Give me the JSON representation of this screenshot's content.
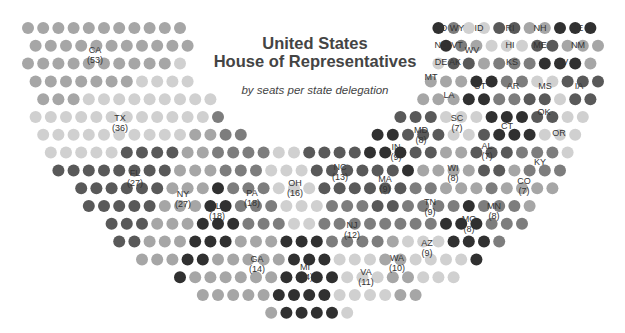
{
  "title_line1": "United States",
  "title_line2": "House of Representatives",
  "subtitle": "by seats per state delegation",
  "colors": {
    "light": "#d0d0d0",
    "medium": "#a6a6a6",
    "middark": "#7d7d7d",
    "dark": "#595959",
    "darkest": "#303030",
    "label_text": "#333333",
    "title_text": "#444444"
  },
  "grid": {
    "center_x": 312,
    "center_y": 28,
    "outer_rx": 292,
    "outer_ry": 288,
    "inner_rx": 124,
    "inner_ry": 124,
    "dx": 15.2,
    "dy": 17.8,
    "top": 28,
    "radius": 6
  },
  "chart_data": {
    "type": "hemicycle",
    "title": "United States House of Representatives",
    "subtitle": "by seats per state delegation",
    "total_seats": 435,
    "states": [
      {
        "state": "CA",
        "seats": 53,
        "x": 95,
        "y": 55
      },
      {
        "state": "TX",
        "seats": 36,
        "x": 120,
        "y": 123
      },
      {
        "state": "FL",
        "seats": 27,
        "x": 135,
        "y": 178
      },
      {
        "state": "NY",
        "seats": 27,
        "x": 183,
        "y": 199
      },
      {
        "state": "IL",
        "seats": 18,
        "x": 217,
        "y": 211
      },
      {
        "state": "PA",
        "seats": 18,
        "x": 252,
        "y": 198
      },
      {
        "state": "OH",
        "seats": 16,
        "x": 295,
        "y": 188
      },
      {
        "state": "NC",
        "seats": 13,
        "x": 340,
        "y": 172
      },
      {
        "state": "GA",
        "seats": 14,
        "x": 257,
        "y": 264
      },
      {
        "state": "MI",
        "seats": 14,
        "x": 305,
        "y": 272
      },
      {
        "state": "NJ",
        "seats": 12,
        "x": 352,
        "y": 230
      },
      {
        "state": "VA",
        "seats": 11,
        "x": 366,
        "y": 277
      },
      {
        "state": "MA",
        "seats": 9,
        "x": 385,
        "y": 184
      },
      {
        "state": "WA",
        "seats": 10,
        "x": 397,
        "y": 263
      },
      {
        "state": "IN",
        "seats": 9,
        "x": 396,
        "y": 152
      },
      {
        "state": "TN",
        "seats": 9,
        "x": 430,
        "y": 207
      },
      {
        "state": "AZ",
        "seats": 9,
        "x": 427,
        "y": 248
      },
      {
        "state": "MD",
        "seats": 8,
        "x": 421,
        "y": 135
      },
      {
        "state": "WI",
        "seats": 8,
        "x": 453,
        "y": 173
      },
      {
        "state": "MO",
        "seats": 8,
        "x": 469,
        "y": 224
      },
      {
        "state": "MN",
        "seats": 8,
        "x": 494,
        "y": 211
      },
      {
        "state": "SC",
        "seats": 7,
        "x": 457,
        "y": 123
      },
      {
        "state": "AL",
        "seats": 7,
        "x": 487,
        "y": 151
      },
      {
        "state": "CO",
        "seats": 7,
        "x": 524,
        "y": 186
      },
      {
        "state": "CT",
        "seats": 5,
        "x": 507,
        "y": 126
      },
      {
        "state": "KY",
        "seats": 6,
        "x": 540,
        "y": 162
      },
      {
        "state": "OR",
        "seats": 5,
        "x": 559,
        "y": 133
      },
      {
        "state": "OK",
        "seats": 5,
        "x": 544,
        "y": 112
      },
      {
        "state": "LA",
        "seats": 6,
        "x": 449,
        "y": 95
      },
      {
        "state": "UT",
        "seats": 4,
        "x": 480,
        "y": 86
      },
      {
        "state": "AR",
        "seats": 4,
        "x": 513,
        "y": 86
      },
      {
        "state": "MS",
        "seats": 4,
        "x": 545,
        "y": 86
      },
      {
        "state": "IA",
        "seats": 4,
        "x": 579,
        "y": 86
      },
      {
        "state": "MT",
        "seats": 1,
        "x": 431,
        "y": 77
      },
      {
        "state": "NV",
        "seats": 4,
        "x": 562,
        "y": 62
      },
      {
        "state": "KS",
        "seats": 4,
        "x": 512,
        "y": 62
      },
      {
        "state": "DE",
        "seats": 1,
        "x": 441,
        "y": 62
      },
      {
        "state": "AK",
        "seats": 1,
        "x": 455,
        "y": 62
      },
      {
        "state": "WV",
        "seats": 3,
        "x": 472,
        "y": 50
      },
      {
        "state": "ND",
        "seats": 1,
        "x": 441,
        "y": 45
      },
      {
        "state": "VT",
        "seats": 1,
        "x": 457,
        "y": 45
      },
      {
        "state": "HI",
        "seats": 2,
        "x": 510,
        "y": 45
      },
      {
        "state": "ME",
        "seats": 2,
        "x": 540,
        "y": 45
      },
      {
        "state": "NM",
        "seats": 3,
        "x": 578,
        "y": 45
      },
      {
        "state": "SD",
        "seats": 1,
        "x": 441,
        "y": 28
      },
      {
        "state": "WY",
        "seats": 1,
        "x": 457,
        "y": 28
      },
      {
        "state": "ID",
        "seats": 2,
        "x": 479,
        "y": 28
      },
      {
        "state": "RI",
        "seats": 2,
        "x": 510,
        "y": 28
      },
      {
        "state": "NH",
        "seats": 2,
        "x": 540,
        "y": 28
      },
      {
        "state": "NE",
        "seats": 3,
        "x": 577,
        "y": 28
      }
    ]
  }
}
